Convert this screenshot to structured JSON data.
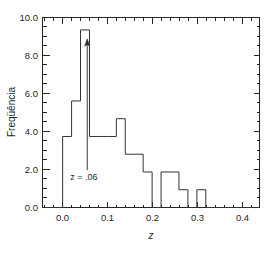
{
  "chart_data": {
    "type": "bar",
    "title": "",
    "subtitle": "",
    "xlabel": "z",
    "ylabel": "Freqüência",
    "xlim": [
      -0.045,
      0.44
    ],
    "ylim": [
      0.0,
      10.7
    ],
    "grid": false,
    "legend": null,
    "bin_width": 0.02,
    "bin_edges": [
      -0.04,
      -0.02,
      0.0,
      0.02,
      0.04,
      0.06,
      0.08,
      0.1,
      0.12,
      0.14,
      0.16,
      0.18,
      0.2,
      0.22,
      0.24,
      0.26,
      0.28,
      0.3,
      0.32,
      0.34,
      0.36,
      0.38,
      0.4,
      0.42
    ],
    "categories": [
      "-0.04",
      "-0.02",
      "0.00",
      "0.02",
      "0.04",
      "0.06",
      "0.08",
      "0.10",
      "0.12",
      "0.14",
      "0.16",
      "0.18",
      "0.20",
      "0.22",
      "0.24",
      "0.26",
      "0.28",
      "0.30",
      "0.32",
      "0.34",
      "0.36",
      "0.38",
      "0.40"
    ],
    "values": [
      0,
      0,
      4,
      6,
      10,
      4,
      4,
      4,
      5,
      3,
      3,
      2,
      0,
      2,
      2,
      1,
      0,
      1,
      0,
      0,
      0,
      0,
      0
    ],
    "xticks": [
      0.0,
      0.1,
      0.2,
      0.3,
      0.4
    ],
    "xtick_labels": [
      "0.0",
      "0.1",
      "0.2",
      "0.3",
      "0.4"
    ],
    "yticks": [
      0.0,
      2.0,
      4.0,
      6.0,
      8.0,
      10.0
    ],
    "ytick_labels": [
      "0.0",
      "2.0",
      "4.0",
      "6.0",
      "8.0",
      "10.0"
    ],
    "x_minor_tick_step": 0.02,
    "y_minor_tick_step": 0.5,
    "annotations": [
      {
        "text": "z = .06",
        "x": 0.06,
        "y": 2.1,
        "arrow_to_x": 0.055,
        "arrow_to_y": 9.5,
        "style": "arrow-up"
      }
    ],
    "colors": {
      "line": "#333333",
      "axis": "#262626",
      "background": "#ffffff",
      "text": "#1f1f1f"
    }
  },
  "figure": {
    "ylabel": "Freqüência",
    "xlabel": "z",
    "annotation_text": "z = .06"
  }
}
